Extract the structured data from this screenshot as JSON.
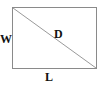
{
  "diagram": {
    "labels": {
      "width": "W",
      "length": "L",
      "diagonal": "D"
    },
    "colors": {
      "background": "#ffffff",
      "edge": "#8a8a8a",
      "diagonal": "#9a9a9a",
      "text": "#111111"
    }
  }
}
